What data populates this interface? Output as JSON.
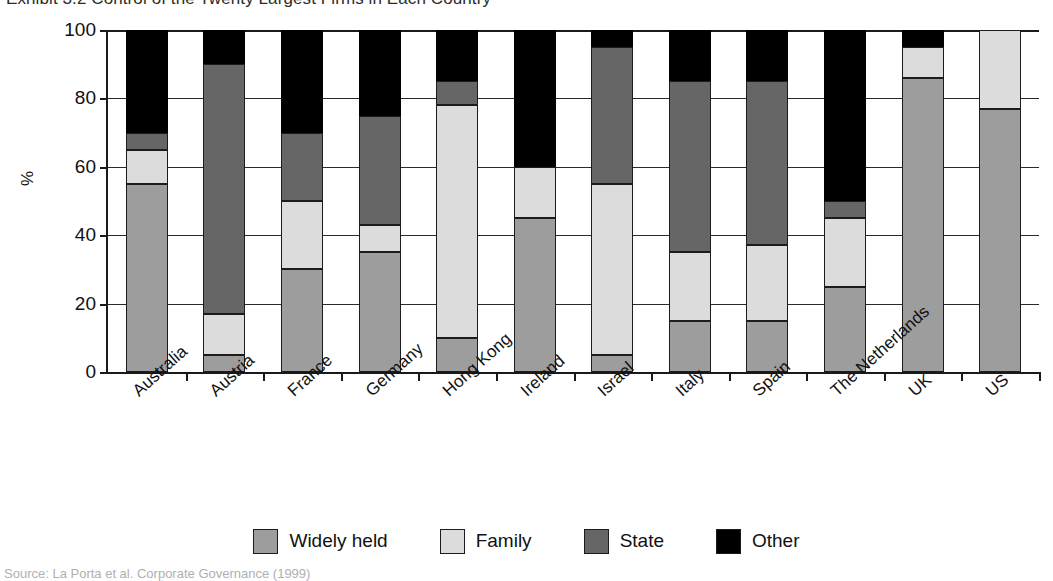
{
  "title": "Exhibit 3.2  Control of the Twenty Largest Firms in Each Country",
  "source_note": "Source: La Porta et al. Corporate Governance (1999)",
  "axis": {
    "y_title": "%",
    "y_ticks": [
      "0",
      "20",
      "40",
      "60",
      "80",
      "100"
    ]
  },
  "legend": {
    "items": [
      {
        "label": "Widely held",
        "color": "#9d9d9d",
        "swatch": "legend-swatch-widely-held"
      },
      {
        "label": "Family",
        "color": "#dcdcdc",
        "swatch": "legend-swatch-family"
      },
      {
        "label": "State",
        "color": "#666666",
        "swatch": "legend-swatch-state"
      },
      {
        "label": "Other",
        "color": "#000000",
        "swatch": "legend-swatch-other"
      }
    ]
  },
  "chart_data": {
    "type": "bar",
    "subtype": "stacked-column",
    "title": "Exhibit 3.2  Control of the Twenty Largest Firms in Each Country",
    "xlabel": "",
    "ylabel": "%",
    "ylim": [
      0,
      100
    ],
    "yticks": [
      0,
      20,
      40,
      60,
      80,
      100
    ],
    "grid": true,
    "legend_position": "bottom",
    "stacked": true,
    "categories": [
      "Australia",
      "Austria",
      "France",
      "Germany",
      "Hong Kong",
      "Ireland",
      "Israel",
      "Italy",
      "Spain",
      "The Netherlands",
      "UK",
      "US"
    ],
    "series": [
      {
        "name": "Widely held",
        "color": "#9d9d9d",
        "values": [
          55,
          5,
          30,
          35,
          10,
          45,
          5,
          15,
          15,
          25,
          86,
          77
        ]
      },
      {
        "name": "Family",
        "color": "#dcdcdc",
        "values": [
          10,
          12,
          20,
          8,
          68,
          15,
          50,
          20,
          22,
          20,
          9,
          23
        ]
      },
      {
        "name": "State",
        "color": "#666666",
        "values": [
          5,
          73,
          20,
          32,
          7,
          0,
          40,
          50,
          48,
          5,
          0,
          0
        ]
      },
      {
        "name": "Other",
        "color": "#000000",
        "values": [
          30,
          10,
          30,
          25,
          15,
          40,
          5,
          15,
          15,
          50,
          5,
          0
        ]
      }
    ]
  }
}
